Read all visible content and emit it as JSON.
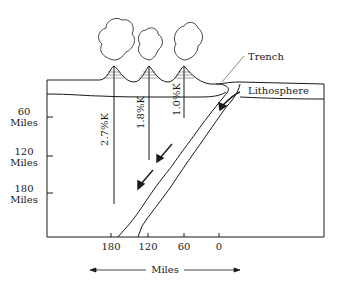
{
  "diagram": {
    "labels": {
      "trench": "Trench",
      "lithosphere": "Lithosphere"
    },
    "y_axis": [
      {
        "value": "60",
        "unit": "Miles"
      },
      {
        "value": "120",
        "unit": "Miles"
      },
      {
        "value": "180",
        "unit": "Miles"
      }
    ],
    "x_axis": {
      "ticks": [
        "180",
        "120",
        "60",
        "0"
      ],
      "label": "Miles"
    },
    "volcano_lines": [
      {
        "label": "2.7%K"
      },
      {
        "label": "1.8%K"
      },
      {
        "label": "1.0%K"
      }
    ],
    "colors": {
      "line": "#1a1a1a",
      "background": "#ffffff"
    }
  }
}
